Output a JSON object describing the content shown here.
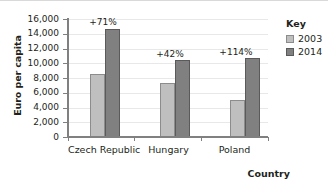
{
  "chart_data": {
    "type": "bar",
    "title": "",
    "xlabel": "Country",
    "ylabel": "Euro per capita",
    "categories": [
      "Czech Republic",
      "Hungary",
      "Poland"
    ],
    "series": [
      {
        "name": "2003",
        "color": "#bfbfbf",
        "values": [
          8600,
          7300,
          5000
        ]
      },
      {
        "name": "2014",
        "color": "#808080",
        "values": [
          14700,
          10400,
          10700
        ]
      }
    ],
    "annotations": [
      "+71%",
      "+42%",
      "+114%"
    ],
    "ylim": [
      0,
      16000
    ],
    "ytick_labels": [
      "16,000",
      "14,000",
      "12,000",
      "10,000",
      "8,000",
      "6,000",
      "4,000",
      "2,000",
      "0"
    ],
    "ytick_values": [
      16000,
      14000,
      12000,
      10000,
      8000,
      6000,
      4000,
      2000,
      0
    ],
    "grid": true,
    "legend_position": "right"
  },
  "legend": {
    "title": "Key",
    "entries": [
      {
        "label": "2003"
      },
      {
        "label": "2014"
      }
    ]
  },
  "axes": {
    "y_title": "Euro per capita",
    "x_title": "Country"
  }
}
